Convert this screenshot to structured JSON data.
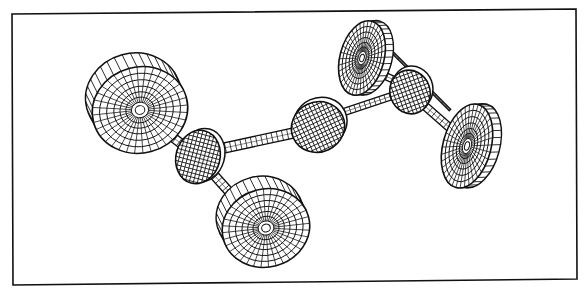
{
  "figure": {
    "type": "wireframe-illustration",
    "background": "#ffffff",
    "stroke": "#111111",
    "frame": {
      "points": [
        [
          12,
          14
        ],
        [
          576,
          9
        ],
        [
          577,
          279
        ],
        [
          13,
          285
        ]
      ]
    },
    "components": {
      "rear_left_wheel": {
        "cx": 140,
        "cy": 110,
        "rx": 48,
        "ry": 43,
        "rot": -15
      },
      "front_left_wheel": {
        "cx": 266,
        "cy": 228,
        "rx": 44,
        "ry": 39,
        "rot": -15
      },
      "rear_right_wheel": {
        "cx": 362,
        "cy": 58,
        "rx": 22,
        "ry": 38,
        "rot": 15
      },
      "front_right_wheel": {
        "cx": 467,
        "cy": 146,
        "rx": 24,
        "ry": 43,
        "rot": 15
      },
      "left_differential": {
        "cx": 198,
        "cy": 157,
        "rx": 22,
        "ry": 27
      },
      "transfer_case": {
        "cx": 318,
        "cy": 127,
        "rx": 27,
        "ry": 25
      },
      "right_differential": {
        "cx": 410,
        "cy": 92,
        "rx": 20,
        "ry": 22
      }
    }
  }
}
